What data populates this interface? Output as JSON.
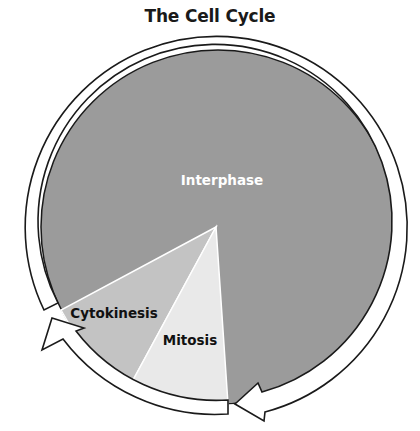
{
  "title": "The Cell Cycle",
  "phases": [
    {
      "name": "Interphase",
      "color": "#9b9b9b",
      "label_color": "#ffffff"
    },
    {
      "name": "Cytokinesis",
      "color": "#c3c3c3",
      "label_color": "#111111"
    },
    {
      "name": "Mitosis",
      "color": "#e9e9e9",
      "label_color": "#111111"
    }
  ],
  "cycle_arrows": [
    {
      "name": "arrow-interphase-to-mitosis",
      "direction": "clockwise"
    },
    {
      "name": "arrow-mitosis-to-cytokinesis",
      "direction": "clockwise"
    }
  ]
}
